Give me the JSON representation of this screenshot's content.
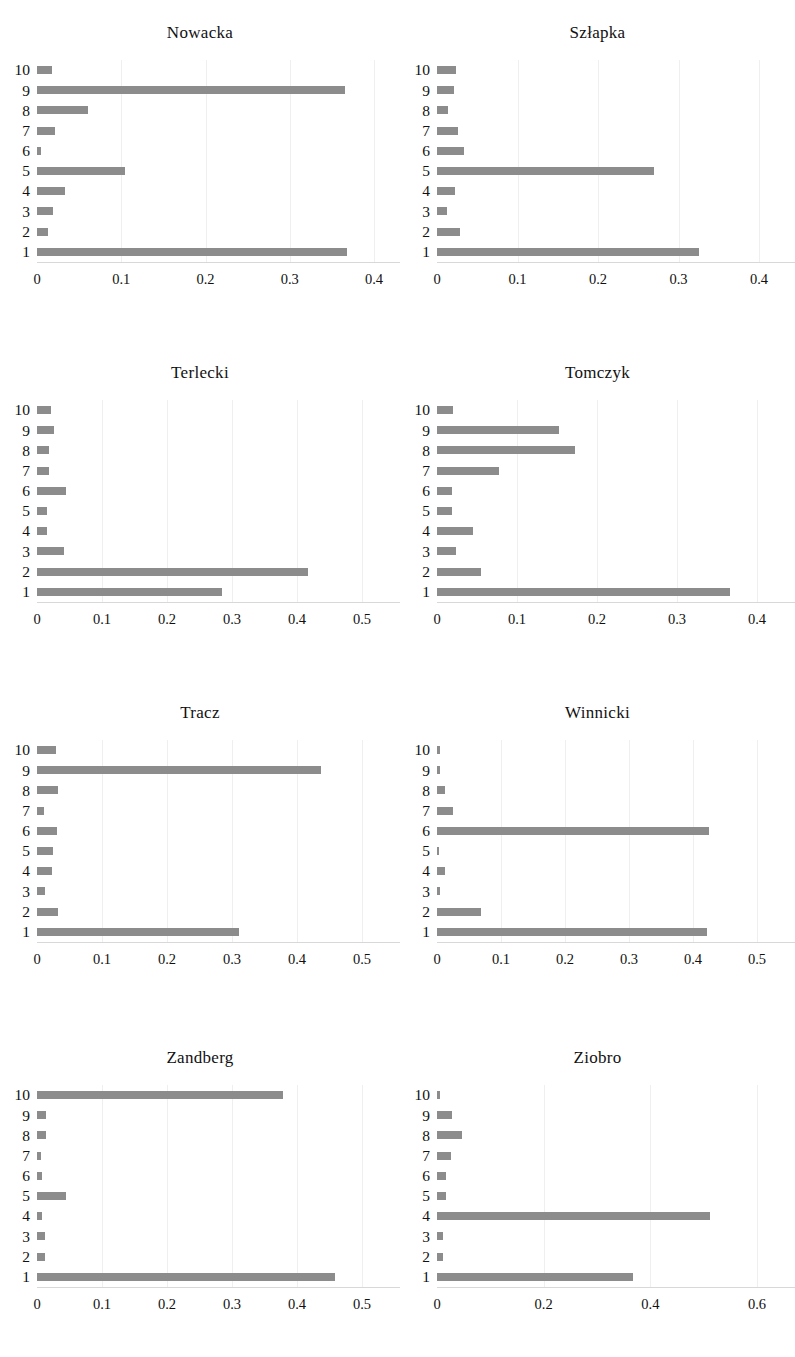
{
  "figure": {
    "layout": "2 columns x 4 rows of small-multiple horizontal bar charts",
    "bar_color": "#8c8c8c",
    "background_color": "#ffffff",
    "category_labels": [
      "10",
      "9",
      "8",
      "7",
      "6",
      "5",
      "4",
      "3",
      "2",
      "1"
    ]
  },
  "chart_data": [
    {
      "type": "bar",
      "orientation": "horizontal",
      "title": "Nowacka",
      "xlabel": "",
      "ylabel": "",
      "categories": [
        "10",
        "9",
        "8",
        "7",
        "6",
        "5",
        "4",
        "3",
        "2",
        "1"
      ],
      "values": [
        0.018,
        0.366,
        0.06,
        0.021,
        0.005,
        0.104,
        0.033,
        0.019,
        0.013,
        0.368
      ],
      "xlim": [
        0,
        0.4
      ],
      "xticks": [
        0,
        0.1,
        0.2,
        0.3,
        0.4
      ],
      "xticklabels": [
        "0",
        "0.1",
        "0.2",
        "0.3",
        "0.4"
      ],
      "grid": true,
      "legend": "none"
    },
    {
      "type": "bar",
      "orientation": "horizontal",
      "title": "Szłapka",
      "xlabel": "",
      "ylabel": "",
      "categories": [
        "10",
        "9",
        "8",
        "7",
        "6",
        "5",
        "4",
        "3",
        "2",
        "1"
      ],
      "values": [
        0.023,
        0.021,
        0.014,
        0.026,
        0.034,
        0.27,
        0.022,
        0.013,
        0.029,
        0.326
      ],
      "xlim": [
        0,
        0.4
      ],
      "xticks": [
        0,
        0.1,
        0.2,
        0.3,
        0.4
      ],
      "xticklabels": [
        "0",
        "0.1",
        "0.2",
        "0.3",
        "0.4"
      ],
      "grid": true,
      "legend": "none"
    },
    {
      "type": "bar",
      "orientation": "horizontal",
      "title": "Terlecki",
      "xlabel": "",
      "ylabel": "",
      "categories": [
        "10",
        "9",
        "8",
        "7",
        "6",
        "5",
        "4",
        "3",
        "2",
        "1"
      ],
      "values": [
        0.021,
        0.026,
        0.019,
        0.019,
        0.044,
        0.016,
        0.015,
        0.042,
        0.417,
        0.285
      ],
      "xlim": [
        0,
        0.5
      ],
      "xticks": [
        0,
        0.1,
        0.2,
        0.3,
        0.4,
        0.5
      ],
      "xticklabels": [
        "0",
        "0.1",
        "0.2",
        "0.3",
        "0.4",
        "0.5"
      ],
      "grid": true,
      "legend": "none"
    },
    {
      "type": "bar",
      "orientation": "horizontal",
      "title": "Tomczyk",
      "xlabel": "",
      "ylabel": "",
      "categories": [
        "10",
        "9",
        "8",
        "7",
        "6",
        "5",
        "4",
        "3",
        "2",
        "1"
      ],
      "values": [
        0.02,
        0.152,
        0.172,
        0.077,
        0.019,
        0.019,
        0.045,
        0.024,
        0.055,
        0.366
      ],
      "xlim": [
        0,
        0.4
      ],
      "xticks": [
        0,
        0.1,
        0.2,
        0.3,
        0.4
      ],
      "xticklabels": [
        "0",
        "0.1",
        "0.2",
        "0.3",
        "0.4"
      ],
      "grid": true,
      "legend": "none"
    },
    {
      "type": "bar",
      "orientation": "horizontal",
      "title": "Tracz",
      "xlabel": "",
      "ylabel": "",
      "categories": [
        "10",
        "9",
        "8",
        "7",
        "6",
        "5",
        "4",
        "3",
        "2",
        "1"
      ],
      "values": [
        0.029,
        0.437,
        0.032,
        0.011,
        0.031,
        0.025,
        0.023,
        0.013,
        0.032,
        0.311
      ],
      "xlim": [
        0,
        0.5
      ],
      "xticks": [
        0,
        0.1,
        0.2,
        0.3,
        0.4,
        0.5
      ],
      "xticklabels": [
        "0",
        "0.1",
        "0.2",
        "0.3",
        "0.4",
        "0.5"
      ],
      "grid": true,
      "legend": "none"
    },
    {
      "type": "bar",
      "orientation": "horizontal",
      "title": "Winnicki",
      "xlabel": "",
      "ylabel": "",
      "categories": [
        "10",
        "9",
        "8",
        "7",
        "6",
        "5",
        "4",
        "3",
        "2",
        "1"
      ],
      "values": [
        0.005,
        0.004,
        0.013,
        0.025,
        0.425,
        0.002,
        0.013,
        0.005,
        0.068,
        0.422
      ],
      "xlim": [
        0,
        0.5
      ],
      "xticks": [
        0,
        0.1,
        0.2,
        0.3,
        0.4,
        0.5
      ],
      "xticklabels": [
        "0",
        "0.1",
        "0.2",
        "0.3",
        "0.4",
        "0.5"
      ],
      "grid": true,
      "legend": "none"
    },
    {
      "type": "bar",
      "orientation": "horizontal",
      "title": "Zandberg",
      "xlabel": "",
      "ylabel": "",
      "categories": [
        "10",
        "9",
        "8",
        "7",
        "6",
        "5",
        "4",
        "3",
        "2",
        "1"
      ],
      "values": [
        0.378,
        0.014,
        0.014,
        0.006,
        0.007,
        0.045,
        0.007,
        0.012,
        0.013,
        0.459
      ],
      "xlim": [
        0,
        0.5
      ],
      "xticks": [
        0,
        0.1,
        0.2,
        0.3,
        0.4,
        0.5
      ],
      "xticklabels": [
        "0",
        "0.1",
        "0.2",
        "0.3",
        "0.4",
        "0.5"
      ],
      "grid": true,
      "legend": "none"
    },
    {
      "type": "bar",
      "orientation": "horizontal",
      "title": "Ziobro",
      "xlabel": "",
      "ylabel": "",
      "categories": [
        "10",
        "9",
        "8",
        "7",
        "6",
        "5",
        "4",
        "3",
        "2",
        "1"
      ],
      "values": [
        0.006,
        0.029,
        0.046,
        0.027,
        0.016,
        0.017,
        0.512,
        0.011,
        0.012,
        0.368
      ],
      "xlim": [
        0,
        0.6
      ],
      "xticks": [
        0,
        0.2,
        0.4,
        0.6
      ],
      "xticklabels": [
        "0",
        "0.2",
        "0.4",
        "0.6"
      ],
      "grid": true,
      "legend": "none"
    }
  ]
}
